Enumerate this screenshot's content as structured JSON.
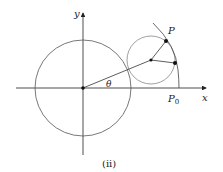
{
  "figure": {
    "caption": "(ii)",
    "labels": {
      "x_axis": "x",
      "y_axis": "y",
      "angle": "θ",
      "point_P": "P",
      "point_P0": "P",
      "point_P0_subscript": "0"
    },
    "colors": {
      "axes": "#222222",
      "large_circle": "#555555",
      "small_circle": "#888888",
      "arc": "#444444",
      "points": "#111111"
    },
    "geometry": {
      "origin": [
        83,
        88
      ],
      "large_circle_radius": 48,
      "small_circle_center": [
        151,
        60
      ],
      "small_circle_radius": 24,
      "point_P": [
        166,
        41
      ],
      "contact_point": [
        175,
        63
      ]
    }
  }
}
